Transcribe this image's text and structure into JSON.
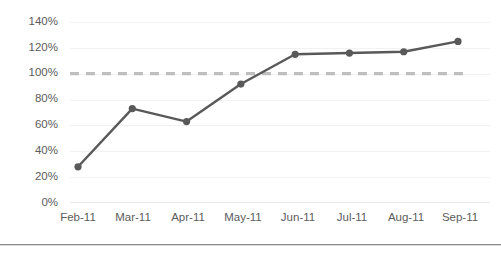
{
  "chart_data": {
    "type": "line",
    "title": "",
    "subtitle": "",
    "xlabel": "",
    "ylabel": "",
    "categories": [
      "Feb-11",
      "Mar-11",
      "Apr-11",
      "May-11",
      "Jun-11",
      "Jul-11",
      "Aug-11",
      "Sep-11"
    ],
    "series": [
      {
        "name": "Series 1",
        "values": [
          28,
          73,
          63,
          92,
          115,
          116,
          117,
          125
        ],
        "color": "#595959",
        "marker": "circle",
        "style": "solid"
      },
      {
        "name": "Reference 100%",
        "values": [
          100,
          100,
          100,
          100,
          100,
          100,
          100,
          100
        ],
        "color": "#bfbfbf",
        "marker": "none",
        "style": "dashed"
      }
    ],
    "ylim": [
      0,
      140
    ],
    "ytick_step": 20,
    "ytick_labels": [
      "140%",
      "120%",
      "100%",
      "80%",
      "60%",
      "40%",
      "20%",
      "0%"
    ],
    "ytick_values": [
      140,
      120,
      100,
      80,
      60,
      40,
      20,
      0
    ],
    "grid": true,
    "grid_axis": "y",
    "legend": false,
    "legend_position": "none",
    "annotations": []
  }
}
